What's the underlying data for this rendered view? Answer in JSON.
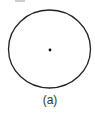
{
  "figure": {
    "caption": "(a)",
    "circle": {
      "cx": 49.5,
      "cy": 49,
      "rx": 41,
      "ry": 39,
      "stroke": "#222222"
    },
    "center_dot": {
      "cx": 50,
      "cy": 50,
      "r": 1.4,
      "fill": "#111111"
    }
  }
}
